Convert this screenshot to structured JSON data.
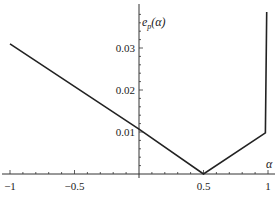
{
  "chart_data": {
    "type": "line",
    "title": "",
    "xlabel": "α",
    "ylabel": "e_p(α)",
    "xlim": [
      -1,
      1
    ],
    "ylim": [
      0,
      0.039
    ],
    "grid": false,
    "legend": null,
    "x_ticks": [
      -1,
      -0.5,
      0.5,
      1
    ],
    "x_tick_labels": [
      "−1",
      "−0.5",
      "0.5",
      "1"
    ],
    "y_ticks": [
      0.01,
      0.02,
      0.03
    ],
    "y_tick_labels": [
      "0.01",
      "0.02",
      "0.03"
    ],
    "series": [
      {
        "name": "e_p(α)",
        "color": "#222222",
        "x": [
          -1,
          0,
          0.5,
          0.98,
          0.99
        ],
        "y": [
          0.031,
          0.0107,
          0.0,
          0.0098,
          0.0386
        ]
      }
    ]
  },
  "labels": {
    "ylabel_main": "e",
    "ylabel_sub": "p",
    "ylabel_arg": "(α)",
    "xlabel": "α"
  }
}
